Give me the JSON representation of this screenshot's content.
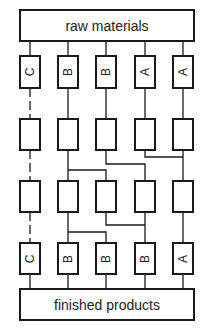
{
  "diagram": {
    "top_label": "raw materials",
    "bottom_label": "finished products",
    "columns": [
      {
        "top": "C",
        "bottom": "C",
        "dashed": true
      },
      {
        "top": "B",
        "bottom": "B",
        "dashed": false
      },
      {
        "top": "B",
        "bottom": "B",
        "dashed": false
      },
      {
        "top": "A",
        "bottom": "B",
        "dashed": false
      },
      {
        "top": "A",
        "bottom": "A",
        "dashed": false
      }
    ],
    "rows": 4,
    "colors": {
      "stroke": "#1a1a1a",
      "background": "#ffffff"
    }
  }
}
